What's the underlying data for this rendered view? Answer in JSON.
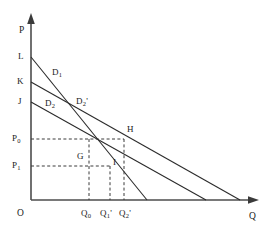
{
  "figure": {
    "type": "economics-demand-curve-diagram",
    "title": "",
    "axes": {
      "y_label": "P",
      "x_label": "Q",
      "origin_label": "O"
    },
    "colors": {
      "axis": "#4d4d4d",
      "curve": "#2b2b2b",
      "dashed": "#3a3a3a",
      "text": "#1a1a1a",
      "background": "#ffffff"
    },
    "price_ticks": [
      {
        "id": "P0",
        "base": "P",
        "sub": "0",
        "y": 139
      },
      {
        "id": "P1",
        "base": "P",
        "sub": "1",
        "y": 166
      }
    ],
    "quantity_ticks": [
      {
        "id": "Q0",
        "base": "Q",
        "sub": "0",
        "prime": "",
        "x": 84
      },
      {
        "id": "Q1p",
        "base": "Q",
        "sub": "1",
        "prime": "'",
        "x": 104
      },
      {
        "id": "Q2p",
        "base": "Q",
        "sub": "2",
        "prime": "'",
        "x": 122
      }
    ],
    "intercepts": [
      {
        "id": "L",
        "label": "L",
        "y": 57
      },
      {
        "id": "K",
        "label": "K",
        "y": 82
      },
      {
        "id": "J",
        "label": "J",
        "y": 102
      }
    ],
    "curve_labels": [
      {
        "id": "D1",
        "base": "D",
        "sub": "1",
        "prime": "",
        "x": 52,
        "y": 68
      },
      {
        "id": "D2",
        "base": "D",
        "sub": "2",
        "prime": "",
        "x": 45,
        "y": 99
      },
      {
        "id": "D2p",
        "base": "D",
        "sub": "2",
        "prime": "'",
        "x": 76,
        "y": 97
      }
    ],
    "point_labels": [
      {
        "id": "G",
        "label": "G",
        "x": 77,
        "y": 152
      },
      {
        "id": "H",
        "label": "H",
        "x": 124,
        "y": 128
      },
      {
        "id": "I",
        "label": "I",
        "x": 112,
        "y": 160
      }
    ],
    "curves": [
      {
        "id": "D1",
        "name": "demand-curve-d1",
        "from_label": "L",
        "x1": 31,
        "y1": 57,
        "x2": 147,
        "y2": 200
      },
      {
        "id": "D2p",
        "name": "demand-curve-d2-prime",
        "from_label": "K",
        "x1": 31,
        "y1": 82,
        "x2": 240,
        "y2": 200
      },
      {
        "id": "D2",
        "name": "demand-curve-d2",
        "from_label": "J",
        "x1": 31,
        "y1": 102,
        "x2": 206,
        "y2": 200
      }
    ]
  }
}
